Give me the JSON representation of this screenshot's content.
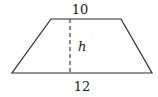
{
  "figure": {
    "shape": "trapezoid",
    "top_base_label": "10",
    "bottom_base_label": "12",
    "height_label": "h",
    "stroke_color": "#2a2a2a",
    "background": "#ffffff"
  },
  "geometry": {
    "vertices": {
      "top_left": [
        51,
        19
      ],
      "top_right": [
        121,
        19
      ],
      "bottom_right": [
        152,
        73
      ],
      "bottom_left": [
        12,
        73
      ]
    },
    "height_line": {
      "x": 70,
      "y1": 19,
      "y2": 73,
      "style": "dashed"
    }
  }
}
